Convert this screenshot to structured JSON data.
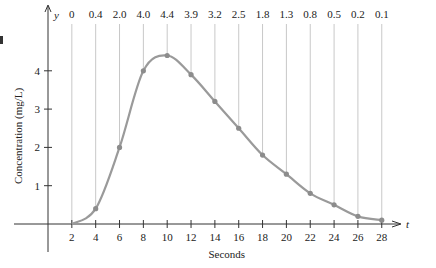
{
  "chart_data": {
    "type": "line",
    "title": "",
    "xlabel": "Seconds",
    "ylabel": "Concentration (mg/L)",
    "x_axis_symbol": "t",
    "y_axis_symbol": "y",
    "x": [
      2,
      4,
      6,
      8,
      10,
      12,
      14,
      16,
      18,
      20,
      22,
      24,
      26,
      28
    ],
    "values": [
      0,
      0.4,
      2.0,
      4.0,
      4.4,
      3.9,
      3.2,
      2.5,
      1.8,
      1.3,
      0.8,
      0.5,
      0.2,
      0.1
    ],
    "top_labels": [
      "0",
      "0.4",
      "2.0",
      "4.0",
      "4.4",
      "3.9",
      "3.2",
      "2.5",
      "1.8",
      "1.3",
      "0.8",
      "0.5",
      "0.2",
      "0.1"
    ],
    "x_ticks": [
      "2",
      "4",
      "6",
      "8",
      "10",
      "12",
      "14",
      "16",
      "18",
      "20",
      "22",
      "24",
      "26",
      "28"
    ],
    "y_ticks": [
      "1",
      "2",
      "3",
      "4"
    ],
    "xlim": [
      0,
      30
    ],
    "ylim": [
      0,
      5
    ],
    "grid": "vertical lines at each data point",
    "legend": null,
    "colors": {
      "curve": "#9a9a9a",
      "points": "#8c8c8c",
      "gridlines": "#c8c8c8",
      "axes": "#333333"
    }
  }
}
